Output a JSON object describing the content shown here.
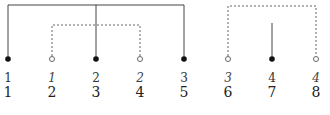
{
  "diagram": {
    "nodes": [
      {
        "pos": 1,
        "x": 8,
        "filled": true,
        "label": "1",
        "label_italic": false
      },
      {
        "pos": 2,
        "x": 52,
        "filled": false,
        "label": "1",
        "label_italic": true
      },
      {
        "pos": 3,
        "x": 96,
        "filled": true,
        "label": "2",
        "label_italic": false
      },
      {
        "pos": 4,
        "x": 140,
        "filled": false,
        "label": "2",
        "label_italic": true
      },
      {
        "pos": 5,
        "x": 184,
        "filled": true,
        "label": "3",
        "label_italic": false
      },
      {
        "pos": 6,
        "x": 228,
        "filled": false,
        "label": "3",
        "label_italic": true
      },
      {
        "pos": 7,
        "x": 272,
        "filled": true,
        "label": "4",
        "label_italic": false
      },
      {
        "pos": 8,
        "x": 316,
        "filled": false,
        "label": "4",
        "label_italic": true
      }
    ],
    "row1_labels": [
      "1",
      "1",
      "2",
      "2",
      "3",
      "3",
      "4",
      "4"
    ],
    "row2_labels": [
      "1",
      "2",
      "3",
      "4",
      "5",
      "6",
      "7",
      "8"
    ],
    "arcs": [
      {
        "style": "solid",
        "from": 1,
        "to": 5,
        "via": [
          3
        ],
        "height": "high"
      },
      {
        "style": "dashed",
        "from": 2,
        "to": 4,
        "height": "low"
      },
      {
        "style": "dashed",
        "from": 6,
        "to": 8,
        "height": "high"
      },
      {
        "style": "solid",
        "stub": 7,
        "height": "short"
      }
    ],
    "caption": "(partially cropped caption text)"
  }
}
